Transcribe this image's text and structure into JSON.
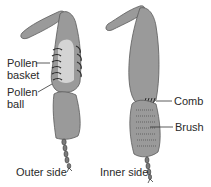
{
  "diagram": {
    "type": "labeled-illustration",
    "views": [
      {
        "label": "Outer side",
        "parts": [
          "Pollen basket",
          "Pollen ball"
        ]
      },
      {
        "label": "Inner side",
        "parts": [
          "Comb",
          "Brush"
        ]
      }
    ]
  },
  "labels": {
    "pollen_basket_1": "Pollen",
    "pollen_basket_2": "basket",
    "pollen_ball_1": "Pollen",
    "pollen_ball_2": "ball",
    "comb": "Comb",
    "brush": "Brush",
    "outer_side": "Outer side",
    "inner_side": "Inner side"
  },
  "colors": {
    "leg_fill": "#9a9a9a",
    "leg_outline": "#5a5a5a",
    "pollen_fill": "#d4d4d4",
    "hair": "#2b2b2b",
    "text": "#2a2a2a"
  }
}
